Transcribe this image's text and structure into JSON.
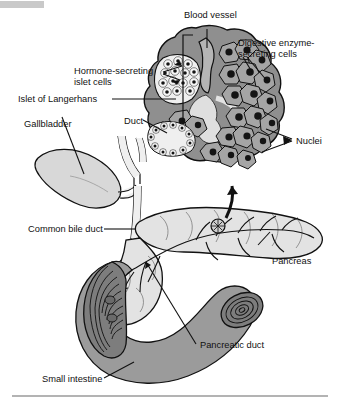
{
  "figure": {
    "title_bar": {
      "visible": true,
      "color": "#c9c9c9"
    },
    "footer_rule": {
      "visible": true,
      "color": "#9a9a9a"
    },
    "background": "#ffffff",
    "line_color": "#111111"
  },
  "palette": {
    "gallbladder_fill": "#d8d8d8",
    "pancreas_fill": "#e3e3e3",
    "intestine_fill": "#9b9b9b",
    "intestine_cut_fill": "#7d7d7d",
    "duct_fill": "#efefef",
    "acinar_cell_fill": "#a5a5a5",
    "islet_fill": "#efefef",
    "nucleus_fill": "#141414",
    "inset_outer_fill": "#8f8f8f",
    "blood_vessel_fill": "#b5b5b5"
  },
  "labels": {
    "blood_vessel": "Blood vessel",
    "digestive_enzyme_cells": "Digestive enzyme-",
    "digestive_enzyme_cells_line2": "secreting cells",
    "hormone_islet_cells": "Hormone-secreting",
    "hormone_islet_cells_line2": "islet cells",
    "islet_of_langerhans": "Islet of Langerhans",
    "gallbladder": "Gallbladder",
    "duct": "Duct",
    "nuclei": "Nuclei",
    "common_bile_duct": "Common bile duct",
    "pancreas": "Pancreas",
    "pancreatic_duct": "Pancreatic duct",
    "small_intestine": "Small intestine"
  }
}
